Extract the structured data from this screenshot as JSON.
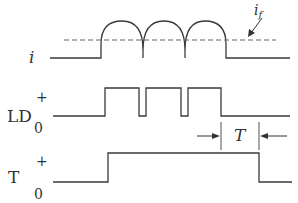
{
  "diagram": {
    "title": "",
    "signals": [
      {
        "id": "i",
        "label": "i",
        "italic": true
      },
      {
        "id": "LD",
        "label": "LD",
        "plus": "+",
        "zero": "0"
      },
      {
        "id": "T",
        "label": "T",
        "plus": "+",
        "zero": "0"
      }
    ],
    "annotations": {
      "i_f": {
        "base": "i",
        "sub": "f"
      },
      "period": "T"
    },
    "colors": {
      "stroke": "#3a3a3a",
      "background": "#ffffff"
    }
  }
}
